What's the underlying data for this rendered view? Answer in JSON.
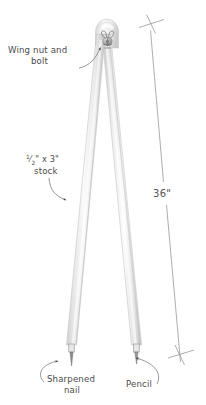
{
  "figure": {
    "background_color": "#ffffff"
  },
  "annotations": {
    "wing_nut": {
      "line1": "Wing nut and",
      "line2": "bolt",
      "name": "wing-nut-and-bolt-label"
    },
    "stock": {
      "fraction_numerator": "1",
      "fraction_denominator": "2",
      "line1_rest": "\" x 3\"",
      "line2": "stock",
      "name": "stock-size-label"
    },
    "dimension": {
      "value": "36\"",
      "name": "overall-length-dimension"
    },
    "nail": {
      "line1": "Sharpened",
      "line2": "nail",
      "name": "sharpened-nail-label"
    },
    "pencil": {
      "line1": "Pencil",
      "name": "pencil-label"
    }
  },
  "colors": {
    "wood_light": "#fbfbfb",
    "wood_mid": "#e3e3e3",
    "wood_shadow": "#c9c9c9",
    "outline": "#c6c6c6",
    "ink": "#4a4a4a",
    "dim_line": "#8a8a8a",
    "metal": "#9a9a9a"
  },
  "parts": [
    {
      "name": "left-leg",
      "label": "Left compass leg"
    },
    {
      "name": "right-leg",
      "label": "Right compass leg"
    },
    {
      "name": "pivot-hardware",
      "label": "Wing nut and bolt pivot"
    },
    {
      "name": "nail-tip",
      "label": "Sharpened nail point"
    },
    {
      "name": "pencil-tip",
      "label": "Pencil point"
    }
  ]
}
